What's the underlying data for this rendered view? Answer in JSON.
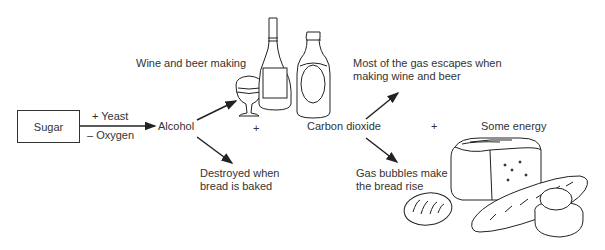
{
  "diagram": {
    "type": "fermentation-flow",
    "nodes": {
      "sugar": "Sugar",
      "alcohol": "Alcohol",
      "carbon_dioxide": "Carbon dioxide",
      "energy": "Some energy"
    },
    "conditions": {
      "yeast": "+ Yeast",
      "oxygen": "– Oxygen"
    },
    "plus_signs": [
      "+",
      "+"
    ],
    "branches": {
      "alcohol_up": "Wine and beer making",
      "alcohol_down_line1": "Destroyed when",
      "alcohol_down_line2": "bread is baked",
      "co2_up_line1": "Most of the gas escapes when",
      "co2_up_line2": "making wine and beer",
      "co2_down_line1": "Gas bubbles make",
      "co2_down_line2": "the bread rise"
    },
    "illustrations": [
      "wine-glass",
      "wine-bottle",
      "beer-bottle",
      "bread-loaf",
      "baguette",
      "bread-roll",
      "cottage-loaf"
    ]
  }
}
